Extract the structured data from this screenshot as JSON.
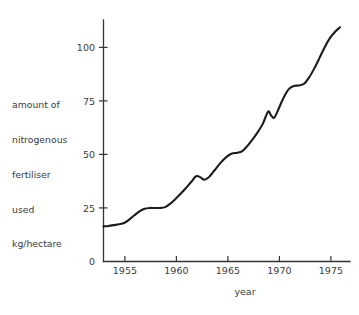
{
  "chart_data": {
    "type": "line",
    "title": "",
    "subtitle": "",
    "xlabel": "year",
    "ylabel": "amount of nitrogenous fertiliser used kg/hectare",
    "ylabel_lines": [
      "amount of",
      "nitrogenous",
      "fertiliser",
      "used",
      "kg/hectare"
    ],
    "xlim": [
      1953,
      1976
    ],
    "ylim": [
      0,
      115
    ],
    "xticks": [
      1955,
      1960,
      1965,
      1970,
      1975
    ],
    "xtick_labels": [
      "1955",
      "1960",
      "1965",
      "1970",
      "1975"
    ],
    "yticks": [
      0,
      25,
      50,
      75,
      100
    ],
    "ytick_labels": [
      "0",
      "25",
      "50",
      "75",
      "100"
    ],
    "grid": false,
    "legend": null,
    "series": [
      {
        "name": "nitrogenous fertiliser used",
        "color": "#1c1c1c",
        "x": [
          1953.0,
          1953.5,
          1954.0,
          1954.5,
          1955.0,
          1955.5,
          1956.0,
          1956.5,
          1957.0,
          1957.5,
          1958.0,
          1958.5,
          1959.0,
          1959.5,
          1960.0,
          1960.5,
          1961.0,
          1961.5,
          1962.0,
          1962.4,
          1962.8,
          1963.2,
          1963.8,
          1964.4,
          1965.0,
          1965.5,
          1966.0,
          1966.5,
          1967.0,
          1967.5,
          1968.0,
          1968.5,
          1969.0,
          1969.3,
          1969.6,
          1970.0,
          1970.5,
          1971.0,
          1971.5,
          1972.0,
          1972.5,
          1973.0,
          1973.5,
          1974.0,
          1974.5,
          1975.0,
          1975.5,
          1976.0
        ],
        "y": [
          16.4,
          16.6,
          17.0,
          17.4,
          18.0,
          19.6,
          21.6,
          23.4,
          24.6,
          25.0,
          25.0,
          25.0,
          25.4,
          27.0,
          29.2,
          31.6,
          34.2,
          37.0,
          39.8,
          39.4,
          38.2,
          39.2,
          42.6,
          46.2,
          49.0,
          50.4,
          50.8,
          51.6,
          54.0,
          57.0,
          60.4,
          64.4,
          70.0,
          68.2,
          67.2,
          71.0,
          76.4,
          80.4,
          82.0,
          82.2,
          83.0,
          86.0,
          90.2,
          95.0,
          100.0,
          104.2,
          107.2,
          109.4
        ]
      }
    ]
  },
  "axes": {
    "x_axis_title": "year",
    "y_axis_title_lines": [
      "amount of",
      "nitrogenous",
      "fertiliser",
      "used",
      "kg/hectare"
    ]
  },
  "ytick_values": [
    "0",
    "25",
    "50",
    "75",
    "100"
  ],
  "xtick_values": [
    "1955",
    "1960",
    "1965",
    "1970",
    "1975"
  ],
  "ylabel_lines": {
    "l0": "amount of",
    "l1": "nitrogenous",
    "l2": "fertiliser",
    "l3": "used",
    "l4": "kg/hectare"
  }
}
